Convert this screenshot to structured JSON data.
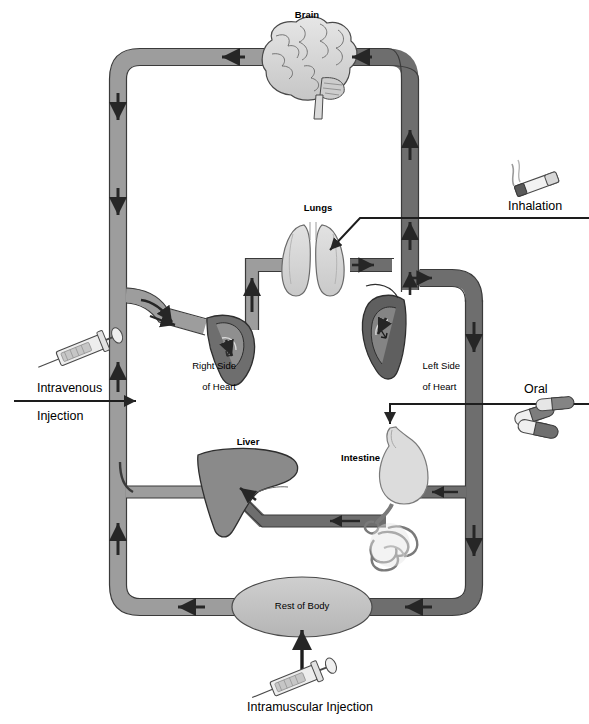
{
  "diagram": {
    "type": "physiology-flow-diagram",
    "organs": [
      {
        "id": "brain",
        "label": "Brain",
        "style": "bold"
      },
      {
        "id": "lungs",
        "label": "Lungs",
        "style": "bold"
      },
      {
        "id": "liver",
        "label": "Liver",
        "style": "bold"
      },
      {
        "id": "intestine",
        "label": "Intestine",
        "style": "bold"
      },
      {
        "id": "right_heart",
        "label": "Right Side\nof Heart",
        "style": "plain"
      },
      {
        "id": "left_heart",
        "label": "Left Side\nof Heart",
        "style": "plain"
      },
      {
        "id": "rest_body",
        "label": "Rest of Body",
        "style": "plain"
      }
    ],
    "routes": [
      {
        "id": "inhalation",
        "label": "Inhalation",
        "icon": "cigarette-icon",
        "target": "lungs"
      },
      {
        "id": "oral",
        "label": "Oral",
        "icon": "pills-icon",
        "target": "intestine"
      },
      {
        "id": "intravenous",
        "label": "Intravenous\nInjection",
        "icon": "syringe-icon",
        "target": "vein"
      },
      {
        "id": "intramuscular",
        "label": "Intramuscular Injection",
        "icon": "syringe-icon",
        "target": "rest_body"
      }
    ],
    "labels": {
      "brain": "Brain",
      "lungs": "Lungs",
      "liver": "Liver",
      "intestine": "Intestine",
      "right_heart_line1": "Right Side",
      "right_heart_line2": "of Heart",
      "left_heart_line1": "Left Side",
      "left_heart_line2": "of Heart",
      "rest_of_body": "Rest of Body",
      "inhalation": "Inhalation",
      "oral": "Oral",
      "intravenous_line1": "Intravenous",
      "intravenous_line2": "Injection",
      "intramuscular": "Intramuscular Injection"
    },
    "colors": {
      "venous_vessel": "#9d9d9d",
      "arterial_vessel": "#6e6e6e",
      "vessel_outline": "#3a3a3a",
      "organ_light": "#d9d9d9",
      "organ_mid": "#bfbfbf",
      "organ_dark": "#7a7a7a",
      "liver_fill": "#8a8a8a",
      "heart_fill": "#5f5f5f",
      "arrow": "#262626",
      "text": "#000000",
      "background": "#ffffff"
    },
    "flow_direction": {
      "left_column": "down then up",
      "right_column": "up then down",
      "top_row": "right to left",
      "bottom_row": "right to left"
    }
  }
}
